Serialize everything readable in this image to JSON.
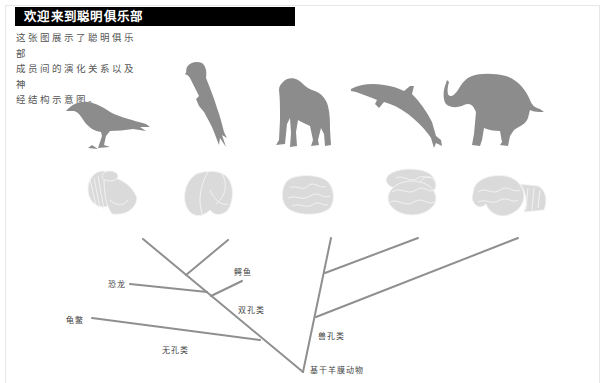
{
  "header": {
    "title": "欢迎来到聪明俱乐部"
  },
  "intro": {
    "lines": [
      "这张图展示了聪明俱乐部",
      "成员间的演化关系以及神",
      "经结构示意图。"
    ]
  },
  "colors": {
    "header_bg": "#000000",
    "header_text": "#ffffff",
    "silhouette": "#8c8c8c",
    "brain": "#d9d9d9",
    "tree_line": "#8f8f8f",
    "label_text": "#444444"
  },
  "animals": [
    {
      "name": "crow",
      "icon": "crow-silhouette-icon"
    },
    {
      "name": "parrot",
      "icon": "parrot-silhouette-icon"
    },
    {
      "name": "chimpanzee",
      "icon": "chimpanzee-silhouette-icon"
    },
    {
      "name": "dolphin",
      "icon": "dolphin-silhouette-icon"
    },
    {
      "name": "elephant",
      "icon": "elephant-silhouette-icon"
    }
  ],
  "brains": [
    {
      "name": "crow-brain",
      "icon": "crow-brain-icon"
    },
    {
      "name": "parrot-brain",
      "icon": "parrot-brain-icon"
    },
    {
      "name": "chimpanzee-brain",
      "icon": "chimpanzee-brain-icon"
    },
    {
      "name": "dolphin-brain",
      "icon": "dolphin-brain-icon"
    },
    {
      "name": "elephant-brain",
      "icon": "elephant-brain-icon"
    }
  ],
  "tree": {
    "labels": {
      "dinosaur": "恐龙",
      "crocodile": "鳄鱼",
      "diapsids": "双孔类",
      "turtle": "龟鳖",
      "anapsids": "无孔类",
      "synapsids": "兽孔类",
      "basal_amniotes": "基干羊膜动物"
    }
  }
}
